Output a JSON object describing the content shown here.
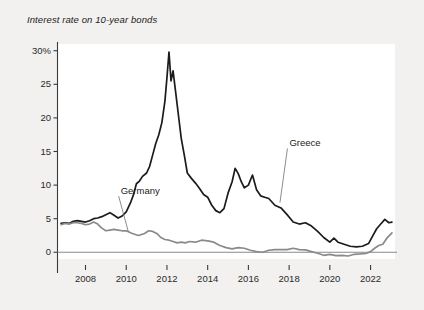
{
  "chart_data": {
    "type": "line",
    "title": "Interest rate on 10-year bonds",
    "xlabel": "",
    "ylabel": "",
    "ylim": [
      -1,
      31
    ],
    "xlim": [
      2006.6,
      2023.2
    ],
    "grid": false,
    "legend_position": "inline-annotations",
    "yticks": [
      {
        "value": 30,
        "label": "30%"
      },
      {
        "value": 25,
        "label": "25"
      },
      {
        "value": 20,
        "label": "20"
      },
      {
        "value": 15,
        "label": "15"
      },
      {
        "value": 10,
        "label": "10"
      },
      {
        "value": 5,
        "label": "5"
      },
      {
        "value": 0,
        "label": "0"
      }
    ],
    "xticks": [
      {
        "value": 2008,
        "label": "2008"
      },
      {
        "value": 2010,
        "label": "2010"
      },
      {
        "value": 2012,
        "label": "2012"
      },
      {
        "value": 2014,
        "label": "2014"
      },
      {
        "value": 2016,
        "label": "2016"
      },
      {
        "value": 2018,
        "label": "2018"
      },
      {
        "value": 2020,
        "label": "2020"
      },
      {
        "value": 2022,
        "label": "2022"
      }
    ],
    "annotations": [
      {
        "text": "Greece",
        "x": 2018.9,
        "y": 16.2,
        "series": "Greece"
      },
      {
        "text": "Germany",
        "x": 2011.2,
        "y": 9.1,
        "series": "Germany"
      }
    ],
    "series": [
      {
        "name": "Greece",
        "color": "#1b1b1b",
        "x": [
          2006.8,
          2007.0,
          2007.2,
          2007.4,
          2007.6,
          2007.8,
          2008.0,
          2008.2,
          2008.4,
          2008.6,
          2008.8,
          2009.0,
          2009.2,
          2009.4,
          2009.6,
          2009.8,
          2010.0,
          2010.2,
          2010.35,
          2010.5,
          2010.65,
          2010.8,
          2011.0,
          2011.15,
          2011.3,
          2011.45,
          2011.6,
          2011.75,
          2011.9,
          2012.0,
          2012.1,
          2012.2,
          2012.3,
          2012.4,
          2012.5,
          2012.6,
          2012.7,
          2012.85,
          2013.0,
          2013.2,
          2013.4,
          2013.6,
          2013.8,
          2014.0,
          2014.2,
          2014.4,
          2014.6,
          2014.8,
          2015.0,
          2015.2,
          2015.35,
          2015.5,
          2015.65,
          2015.8,
          2016.0,
          2016.2,
          2016.4,
          2016.6,
          2016.8,
          2017.0,
          2017.3,
          2017.6,
          2017.9,
          2018.2,
          2018.5,
          2018.8,
          2019.1,
          2019.4,
          2019.7,
          2020.0,
          2020.2,
          2020.4,
          2020.7,
          2021.0,
          2021.3,
          2021.6,
          2021.9,
          2022.1,
          2022.3,
          2022.5,
          2022.7,
          2022.9,
          2023.05
        ],
        "y": [
          4.3,
          4.4,
          4.3,
          4.6,
          4.7,
          4.6,
          4.5,
          4.7,
          5.0,
          5.1,
          5.3,
          5.6,
          5.9,
          5.5,
          5.1,
          5.4,
          6.0,
          7.3,
          8.5,
          10.2,
          10.6,
          11.3,
          11.8,
          12.8,
          14.5,
          16.2,
          17.5,
          19.3,
          22.5,
          26.0,
          29.8,
          25.5,
          27.0,
          24.5,
          22.0,
          19.5,
          17.0,
          14.5,
          11.8,
          11.0,
          10.3,
          9.5,
          8.6,
          8.2,
          7.0,
          6.2,
          5.9,
          6.5,
          8.8,
          10.5,
          12.5,
          11.7,
          10.5,
          9.6,
          10.0,
          11.5,
          9.3,
          8.4,
          8.2,
          8.0,
          7.0,
          6.6,
          5.6,
          4.5,
          4.2,
          4.4,
          3.9,
          3.1,
          2.2,
          1.5,
          2.1,
          1.5,
          1.2,
          0.9,
          0.8,
          0.9,
          1.3,
          2.4,
          3.5,
          4.2,
          4.9,
          4.4,
          4.5
        ]
      },
      {
        "name": "Germany",
        "color": "#8a8a8a",
        "x": [
          2006.8,
          2007.0,
          2007.2,
          2007.4,
          2007.6,
          2007.8,
          2008.0,
          2008.2,
          2008.4,
          2008.6,
          2008.8,
          2009.0,
          2009.2,
          2009.4,
          2009.6,
          2009.8,
          2010.0,
          2010.3,
          2010.6,
          2010.9,
          2011.1,
          2011.3,
          2011.5,
          2011.7,
          2011.9,
          2012.1,
          2012.3,
          2012.5,
          2012.7,
          2012.9,
          2013.1,
          2013.4,
          2013.7,
          2014.0,
          2014.3,
          2014.6,
          2014.9,
          2015.2,
          2015.5,
          2015.8,
          2016.1,
          2016.4,
          2016.7,
          2017.0,
          2017.3,
          2017.6,
          2017.9,
          2018.2,
          2018.5,
          2018.8,
          2019.1,
          2019.4,
          2019.7,
          2020.0,
          2020.3,
          2020.6,
          2020.9,
          2021.2,
          2021.5,
          2021.8,
          2022.0,
          2022.2,
          2022.4,
          2022.6,
          2022.8,
          2023.05
        ],
        "y": [
          4.1,
          4.3,
          4.2,
          4.4,
          4.4,
          4.3,
          4.1,
          4.2,
          4.5,
          4.2,
          3.6,
          3.2,
          3.3,
          3.4,
          3.3,
          3.2,
          3.2,
          2.8,
          2.5,
          2.8,
          3.2,
          3.1,
          2.8,
          2.2,
          1.9,
          1.8,
          1.6,
          1.4,
          1.5,
          1.4,
          1.6,
          1.5,
          1.8,
          1.7,
          1.5,
          1.0,
          0.7,
          0.5,
          0.7,
          0.6,
          0.3,
          0.1,
          0.0,
          0.3,
          0.4,
          0.4,
          0.4,
          0.6,
          0.4,
          0.35,
          0.1,
          -0.15,
          -0.45,
          -0.3,
          -0.5,
          -0.45,
          -0.55,
          -0.3,
          -0.25,
          -0.15,
          0.1,
          0.6,
          1.0,
          1.2,
          2.1,
          2.9
        ]
      }
    ]
  }
}
